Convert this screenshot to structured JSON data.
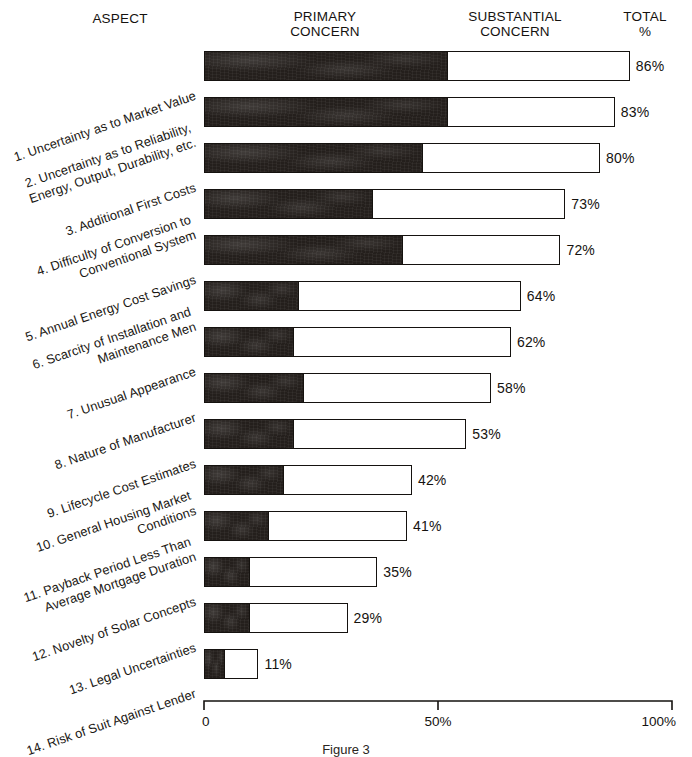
{
  "headers": {
    "aspect": "ASPECT",
    "primary": "PRIMARY\nCONCERN",
    "substantial": "SUBSTANTIAL\nCONCERN",
    "total": "TOTAL\n%"
  },
  "axis": {
    "ticks": [
      "0",
      "50%",
      "100%"
    ],
    "tick_values": [
      0,
      50,
      100
    ]
  },
  "caption": "Figure 3",
  "colors": {
    "primary_fill": "#241f1c",
    "substantial_fill": "#ffffff",
    "outline": "#15120f",
    "background": "#ffffff"
  },
  "chart_data": {
    "type": "bar",
    "title": "",
    "subtitle": "",
    "xlabel": "",
    "ylabel": "ASPECT",
    "xlim": [
      0,
      100
    ],
    "grid": false,
    "orientation": "horizontal",
    "stacked": true,
    "legend_position": "top",
    "categories": [
      "1. Uncertainty as to Market Value",
      "2. Uncertainty as to Reliability,\nEnergy, Output, Durability, etc.",
      "3. Additional First Costs",
      "4. Difficulty of Conversion to\nConventional System",
      "5. Annual Energy Cost Savings",
      "6. Scarcity of Installation and\nMaintenance Men",
      "7. Unusual Appearance",
      "8. Nature of Manufacturer",
      "9. Lifecycle Cost Estimates",
      "10. General Housing Market\nConditions",
      "11. Payback Period Less Than\nAverage Mortgage Duration",
      "12. Novelty of Solar Concepts",
      "13. Legal Uncertainties",
      "14. Risk of Suit Against Lender"
    ],
    "series": [
      {
        "name": "PRIMARY CONCERN",
        "values": [
          49,
          49,
          44,
          34,
          40,
          19,
          18,
          20,
          18,
          16,
          13,
          9,
          9,
          4
        ]
      },
      {
        "name": "SUBSTANTIAL CONCERN",
        "values": [
          37,
          34,
          36,
          39,
          32,
          45,
          44,
          38,
          35,
          26,
          28,
          26,
          20,
          7
        ]
      }
    ],
    "totals": [
      86,
      83,
      80,
      73,
      72,
      64,
      62,
      58,
      53,
      42,
      41,
      35,
      29,
      11
    ],
    "total_labels": [
      "86%",
      "83%",
      "80%",
      "73%",
      "72%",
      "64%",
      "62%",
      "58%",
      "53%",
      "42%",
      "41%",
      "35%",
      "29%",
      "11%"
    ]
  }
}
